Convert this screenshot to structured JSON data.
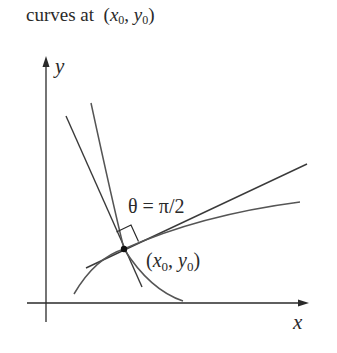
{
  "caption": {
    "prefix": "curves at",
    "point_x": "x",
    "point_y": "y",
    "subscript": "0"
  },
  "diagram": {
    "axis_x_label": "x",
    "axis_y_label": "y",
    "angle_label": "θ = π/2",
    "point_label_x": "x",
    "point_label_y": "y",
    "point_subscript": "0",
    "colors": {
      "ink": "#2a2a2a",
      "curve": "#555555",
      "background": "#ffffff"
    }
  }
}
